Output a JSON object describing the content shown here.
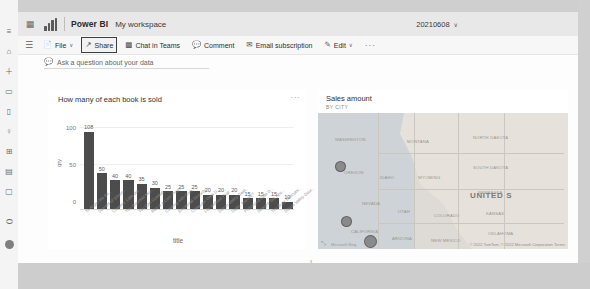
{
  "topbar": {
    "waffle_icon": "waffle-icon",
    "logo_icon": "power-bi-logo",
    "brand": "Power BI",
    "workspace": "My workspace",
    "report_name": "20210608",
    "report_caret": "∨"
  },
  "ribbon": {
    "hamburger_icon": "hamburger-icon",
    "items": [
      {
        "label": "File",
        "icon": "⬜",
        "icon_name": "file-icon",
        "caret": "∨",
        "selected": false
      },
      {
        "label": "Share",
        "icon": "↗",
        "icon_name": "share-icon",
        "caret": "",
        "selected": true
      },
      {
        "label": "Chat in Teams",
        "icon": "⬛",
        "icon_name": "teams-icon",
        "caret": "",
        "selected": false
      },
      {
        "label": "Comment",
        "icon": "▭",
        "icon_name": "comment-icon",
        "caret": "",
        "selected": false
      },
      {
        "label": "Email subscription",
        "icon": "✉",
        "icon_name": "email-icon",
        "caret": "",
        "selected": false
      },
      {
        "label": "Edit",
        "icon": "✎",
        "icon_name": "edit-pencil-icon",
        "caret": "∨",
        "selected": false
      }
    ],
    "overflow_label": "···"
  },
  "qna": {
    "icon": "▭",
    "icon_name": "qna-bubble-icon",
    "placeholder": "Ask a question about your data"
  },
  "rail": {
    "items": [
      {
        "name": "nav-menu",
        "glyph": "≡"
      },
      {
        "name": "home",
        "glyph": "⌂"
      },
      {
        "name": "create",
        "glyph": "＋"
      },
      {
        "name": "browse",
        "glyph": "▭"
      },
      {
        "name": "data-hub",
        "glyph": "▯"
      },
      {
        "name": "metrics",
        "glyph": "♀"
      },
      {
        "name": "apps",
        "glyph": "⊞"
      },
      {
        "name": "deployment",
        "glyph": "▤"
      },
      {
        "name": "learn",
        "glyph": "▢"
      },
      {
        "name": "workspaces",
        "glyph": "⬭"
      }
    ],
    "avatar_name": "user-avatar"
  },
  "visuals": {
    "bar": {
      "title": "How many of each book is sold",
      "ellipsis": "···"
    },
    "map": {
      "title": "Sales amount",
      "subtitle": "BY CITY",
      "credit": "Microsoft Bing",
      "attribution": "© 2022 TomTom, © 2022 Microsoft Corporation  Terms",
      "resize_icon": "⤡",
      "states": [
        {
          "label": "WASHINGTON",
          "x": 17,
          "y": 24
        },
        {
          "label": "MONTANA",
          "x": 89,
          "y": 26
        },
        {
          "label": "NORTH DAKOTA",
          "x": 155,
          "y": 22
        },
        {
          "label": "OREGON",
          "x": 26,
          "y": 57
        },
        {
          "label": "IDAHO",
          "x": 62,
          "y": 62
        },
        {
          "label": "WYOMING",
          "x": 100,
          "y": 62
        },
        {
          "label": "SOUTH DAKOTA",
          "x": 155,
          "y": 52
        },
        {
          "label": "NEBRASKA",
          "x": 160,
          "y": 77
        },
        {
          "label": "NEVADA",
          "x": 44,
          "y": 88
        },
        {
          "label": "UTAH",
          "x": 80,
          "y": 96
        },
        {
          "label": "COLORADO",
          "x": 116,
          "y": 100
        },
        {
          "label": "CALIFORNIA",
          "x": 33,
          "y": 116
        },
        {
          "label": "ARIZONA",
          "x": 74,
          "y": 123
        },
        {
          "label": "NEW MEXICO",
          "x": 113,
          "y": 125
        },
        {
          "label": "KANSAS",
          "x": 168,
          "y": 98
        },
        {
          "label": "OKLAHOMA",
          "x": 170,
          "y": 118
        }
      ],
      "country_label": "UNITED S",
      "bubbles": [
        {
          "x": 17,
          "y": 48,
          "size": 9
        },
        {
          "x": 23,
          "y": 103,
          "size": 9
        },
        {
          "x": 46,
          "y": 122,
          "size": 11
        }
      ]
    }
  },
  "page_indicator": "‹",
  "chart_data": {
    "type": "bar",
    "title": "How many of each book is sold",
    "xlabel": "title",
    "ylabel": "qty",
    "ylim": [
      0,
      120
    ],
    "yticks": [
      0,
      50,
      100
    ],
    "grid": true,
    "legend": false,
    "bar_color": "#4c4c4c",
    "categories": [
      "To Anger the En...",
      "Secrets of Silicon...",
      "Chasers' Little Jet...",
      "The Gourmet Mor...",
      "You Can Combat...",
      "Bart is a Liver Press...",
      "Cooking with Com...",
      "Emotional Security...",
      "Computer Data D...",
      "Life Without Fear",
      "Silicon Valley Gast...",
      "Sushi, Anyone?",
      "Prolonged Data D...",
      "Straight Talk Abo...",
      "The Busy Executiv...",
      "Silicon Valley Gour..."
    ],
    "values": [
      108,
      50,
      40,
      40,
      35,
      30,
      25,
      25,
      25,
      20,
      20,
      20,
      15,
      15,
      15,
      10
    ],
    "data_labels": [
      "108",
      "50",
      "40",
      "40",
      "35",
      "30",
      "25",
      "25",
      "25",
      "20",
      "20",
      "20",
      "15",
      "15",
      "15",
      "10"
    ]
  }
}
